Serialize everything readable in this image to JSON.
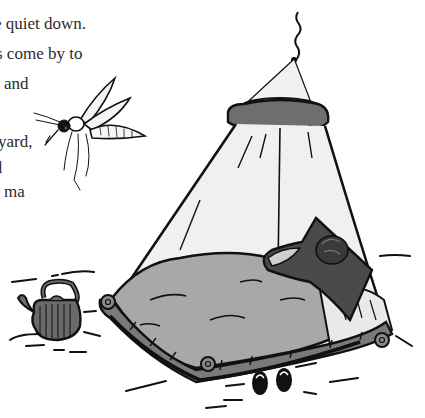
{
  "page_text": {
    "lines": [
      {
        "text": "e quiet down.",
        "x": -6,
        "y": 14
      },
      {
        "text": "s come by to",
        "x": -4,
        "y": 44
      },
      {
        "text": "and",
        "x": 4,
        "y": 74
      },
      {
        "text": "yard,",
        "x": -2,
        "y": 132
      },
      {
        "text": "l",
        "x": -2,
        "y": 158
      },
      {
        "text": "ma",
        "x": 4,
        "y": 182
      }
    ]
  },
  "illustration": {
    "subjects": [
      "mosquito",
      "mosquito-net-tent",
      "bed",
      "sleeping-person",
      "kettle",
      "sandals"
    ],
    "colors": {
      "ink": "#111111",
      "net_fill": "#efefef",
      "ruffle_gray": "#6e6e6e",
      "blanket_gray": "#a8a8a8",
      "pillow_dark": "#4a4a4a",
      "bed_frame_gray": "#7a7a7a",
      "kettle_gray": "#6a6a6a",
      "text": "#2b2b2b",
      "background": "#ffffff"
    }
  }
}
